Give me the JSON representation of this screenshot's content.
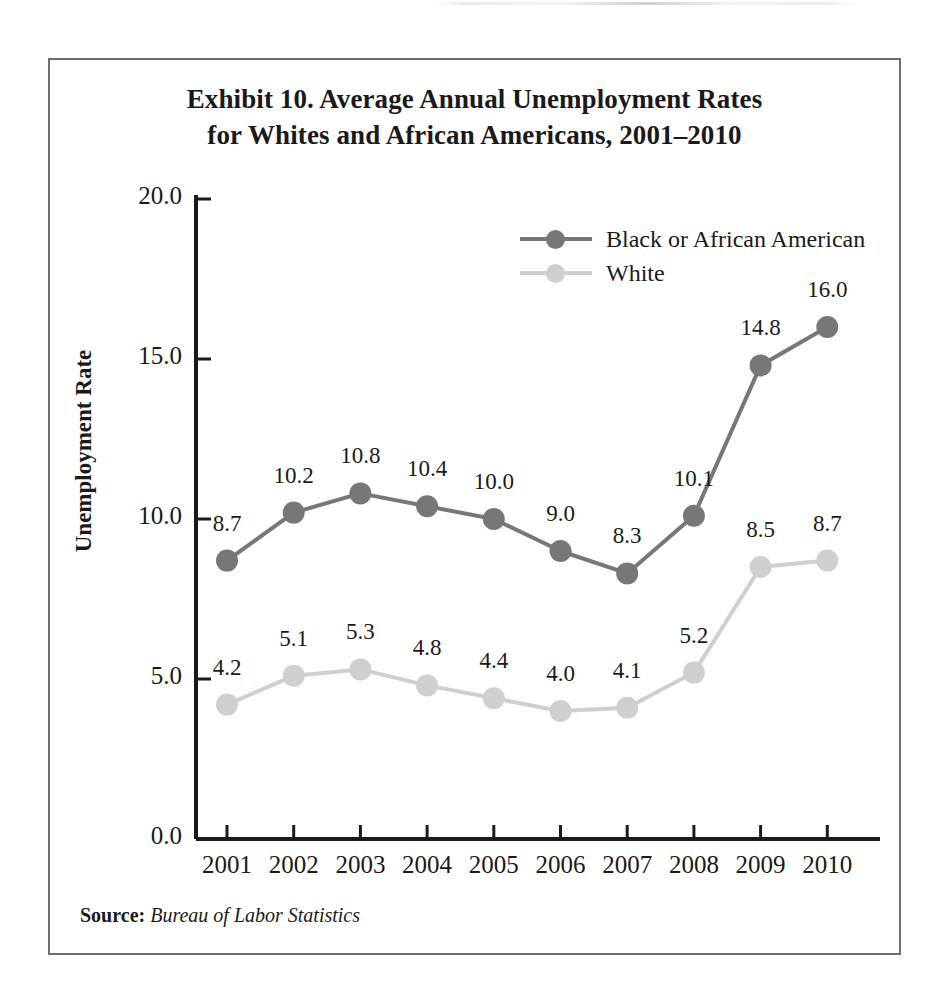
{
  "figure": {
    "title_line1": "Exhibit 10. Average Annual Unemployment Rates",
    "title_line2": "for Whites and African Americans, 2001–2010",
    "source_label": "Source:",
    "source_value": "Bureau of Labor Statistics"
  },
  "colors": {
    "series_black": "#777777",
    "series_white": "#cfcfcf",
    "axis": "#1a1a1a",
    "frame": "#6f6f6f",
    "text": "#1a1a1a"
  },
  "chart_data": {
    "type": "line",
    "title": "Exhibit 10. Average Annual Unemployment Rates for Whites and African Americans, 2001–2010",
    "xlabel": "",
    "ylabel": "Unemployment Rate",
    "categories": [
      "2001",
      "2002",
      "2003",
      "2004",
      "2005",
      "2006",
      "2007",
      "2008",
      "2009",
      "2010"
    ],
    "ylim": [
      0.0,
      20.0
    ],
    "yticks": [
      "0.0",
      "5.0",
      "10.0",
      "15.0",
      "20.0"
    ],
    "ytick_values": [
      0.0,
      5.0,
      10.0,
      15.0,
      20.0
    ],
    "grid": false,
    "legend_position": "top-right",
    "data_labels": true,
    "series": [
      {
        "name": "Black or African American",
        "color": "#777777",
        "values": [
          8.7,
          10.2,
          10.8,
          10.4,
          10.0,
          9.0,
          8.3,
          10.1,
          14.8,
          16.0
        ],
        "labels": [
          "8.7",
          "10.2",
          "10.8",
          "10.4",
          "10.0",
          "9.0",
          "8.3",
          "10.1",
          "14.8",
          "16.0"
        ]
      },
      {
        "name": "White",
        "color": "#cfcfcf",
        "values": [
          4.2,
          5.1,
          5.3,
          4.8,
          4.4,
          4.0,
          4.1,
          5.2,
          8.5,
          8.7
        ],
        "labels": [
          "4.2",
          "5.1",
          "5.3",
          "4.8",
          "4.4",
          "4.0",
          "4.1",
          "5.2",
          "8.5",
          "8.7"
        ]
      }
    ]
  }
}
